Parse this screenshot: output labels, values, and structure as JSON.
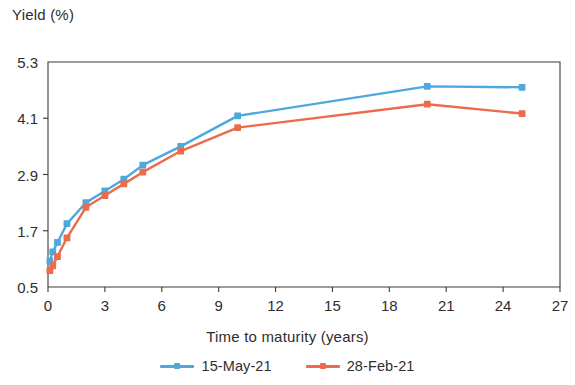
{
  "chart_data": {
    "type": "line",
    "title": "",
    "xlabel": "Time to maturity (years)",
    "ylabel": "Yield (%)",
    "xlim": [
      0,
      27
    ],
    "ylim": [
      0.5,
      5.3
    ],
    "xticks": [
      "0",
      "3",
      "6",
      "9",
      "12",
      "15",
      "18",
      "21",
      "24",
      "27"
    ],
    "xtick_values": [
      0,
      3,
      6,
      9,
      12,
      15,
      18,
      21,
      24,
      27
    ],
    "yticks": [
      "0.5",
      "1.7",
      "2.9",
      "4.1",
      "5.3"
    ],
    "ytick_values": [
      0.5,
      1.7,
      2.9,
      4.1,
      5.3
    ],
    "grid": false,
    "legend_position": "bottom",
    "series": [
      {
        "name": "15-May-21",
        "color": "#4FA8DC",
        "marker": "square",
        "x": [
          0.1,
          0.25,
          0.5,
          1,
          2,
          3,
          4,
          5,
          7,
          10,
          20,
          25
        ],
        "y": [
          1.05,
          1.25,
          1.45,
          1.85,
          2.3,
          2.55,
          2.8,
          3.1,
          3.5,
          4.15,
          4.78,
          4.76
        ]
      },
      {
        "name": "28-Feb-21",
        "color": "#EC6B4B",
        "marker": "square",
        "x": [
          0.1,
          0.25,
          0.5,
          1,
          2,
          3,
          4,
          5,
          7,
          10,
          20,
          25
        ],
        "y": [
          0.85,
          0.95,
          1.15,
          1.55,
          2.2,
          2.45,
          2.7,
          2.95,
          3.4,
          3.9,
          4.4,
          4.2
        ]
      }
    ]
  },
  "axes": {
    "y_title": "Yield (%)",
    "x_title": "Time to maturity (years)"
  },
  "legend": {
    "entries": [
      {
        "label": "15-May-21",
        "color": "#4FA8DC"
      },
      {
        "label": "28-Feb-21",
        "color": "#EC6B4B"
      }
    ]
  },
  "colors": {
    "series_1": "#4FA8DC",
    "series_2": "#EC6B4B",
    "axis": "#3a3a3a",
    "text": "#2e2e2e",
    "background": "#ffffff"
  }
}
